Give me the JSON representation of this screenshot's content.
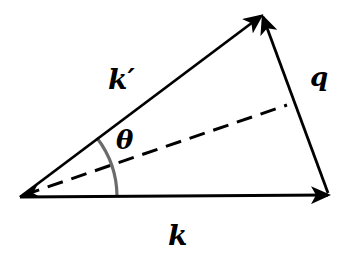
{
  "diagram": {
    "labels": {
      "k_prime": "k′",
      "q": "q",
      "theta": "θ",
      "k": "k"
    },
    "vectors": [
      {
        "name": "k",
        "from": [
          20,
          197
        ],
        "to": [
          328,
          195
        ],
        "style": "solid",
        "arrow": true
      },
      {
        "name": "k_prime",
        "from": [
          20,
          197
        ],
        "to": [
          262,
          15
        ],
        "style": "solid",
        "arrow": true
      },
      {
        "name": "q",
        "from": [
          328,
          193
        ],
        "to": [
          262,
          15
        ],
        "style": "solid",
        "arrow": true
      },
      {
        "name": "bisector",
        "from": [
          22,
          196
        ],
        "to": [
          287,
          105
        ],
        "style": "dashed",
        "arrow": false
      }
    ],
    "angle_arc": {
      "label": "theta",
      "center": [
        20,
        197
      ],
      "radius": 97,
      "color": "#6b6b6b"
    },
    "colors": {
      "line": "#000000",
      "arc": "#6b6b6b",
      "background": "#ffffff"
    }
  }
}
